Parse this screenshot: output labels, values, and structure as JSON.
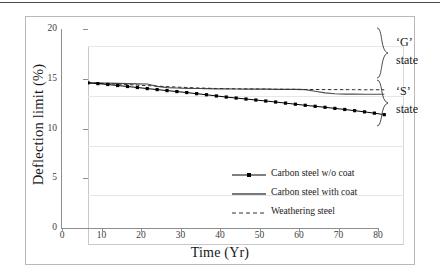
{
  "chart_data": {
    "type": "line",
    "title": "",
    "xlabel": "Time (Yr)",
    "ylabel": "Deflection limit (%)",
    "xlim": [
      0,
      80
    ],
    "ylim": [
      0,
      20
    ],
    "xticks": [
      0,
      10,
      20,
      30,
      40,
      50,
      60,
      70,
      80
    ],
    "yticks": [
      0,
      5,
      10,
      15,
      20
    ],
    "grid": "horizontal",
    "legend_position": "inside-center-right",
    "x": [
      0,
      2.5,
      5,
      7.5,
      10,
      12.5,
      15,
      17.5,
      20,
      22.5,
      25,
      27.5,
      30,
      32.5,
      35,
      37.5,
      40,
      42.5,
      45,
      47.5,
      50,
      52.5,
      55,
      57.5,
      60,
      62.5,
      65,
      67.5,
      70,
      72.5,
      75
    ],
    "series": [
      {
        "name": "Carbon steel w/o coat",
        "style": "line-with-markers",
        "color": "#000000",
        "values": [
          16.3,
          16.22,
          16.13,
          16.03,
          15.93,
          15.83,
          15.72,
          15.62,
          15.52,
          15.42,
          15.32,
          15.21,
          15.1,
          14.98,
          14.87,
          14.77,
          14.67,
          14.57,
          14.47,
          14.37,
          14.26,
          14.15,
          14.04,
          13.94,
          13.84,
          13.73,
          13.62,
          13.5,
          13.38,
          13.25,
          13.1
        ]
      },
      {
        "name": "Carbon steel with coat",
        "style": "solid-line",
        "color": "#4d4d4d",
        "values": [
          16.3,
          16.28,
          16.26,
          16.24,
          16.22,
          16.2,
          16.18,
          15.95,
          15.82,
          15.78,
          15.75,
          15.73,
          15.71,
          15.7,
          15.69,
          15.68,
          15.67,
          15.66,
          15.66,
          15.65,
          15.65,
          15.64,
          15.62,
          15.45,
          15.28,
          15.2,
          15.17,
          15.16,
          15.15,
          15.15,
          15.15
        ]
      },
      {
        "name": "Weathering steel",
        "style": "dashed-line",
        "color": "#2e2e2e",
        "values": [
          16.3,
          16.26,
          16.22,
          16.17,
          16.12,
          16.07,
          16.02,
          15.97,
          15.92,
          15.87,
          15.83,
          15.79,
          15.76,
          15.73,
          15.71,
          15.7,
          15.69,
          15.68,
          15.67,
          15.66,
          15.65,
          15.64,
          15.63,
          15.63,
          15.62,
          15.62,
          15.61,
          15.61,
          15.6,
          15.6,
          15.6
        ]
      }
    ],
    "annotations": [
      {
        "name": "g-state",
        "label_line1": "‘G’",
        "label_line2": "state",
        "brace_top_value": 20.0,
        "brace_bottom_value": 15.1
      },
      {
        "name": "s-state",
        "label_line1": "‘S’",
        "label_line2": "state",
        "brace_top_value": 15.05,
        "brace_bottom_value": 10.4
      }
    ]
  },
  "axis": {
    "y_title": "Deflection limit (%)",
    "x_title": "Time (Yr)",
    "y_tick_labels": [
      "20",
      "15",
      "10",
      "5",
      "0"
    ],
    "x_tick_labels": [
      "0",
      "10",
      "20",
      "30",
      "40",
      "50",
      "60",
      "70",
      "80"
    ]
  },
  "legend": {
    "items": [
      {
        "label": "Carbon steel w/o coat",
        "style": "line-with-markers"
      },
      {
        "label": "Carbon steel with coat",
        "style": "solid-line"
      },
      {
        "label": "Weathering steel",
        "style": "dashed-line"
      }
    ]
  },
  "annotations": {
    "g_state_line1": "‘G’",
    "g_state_line2": "state",
    "s_state_line1": "‘S’",
    "s_state_line2": "state"
  }
}
